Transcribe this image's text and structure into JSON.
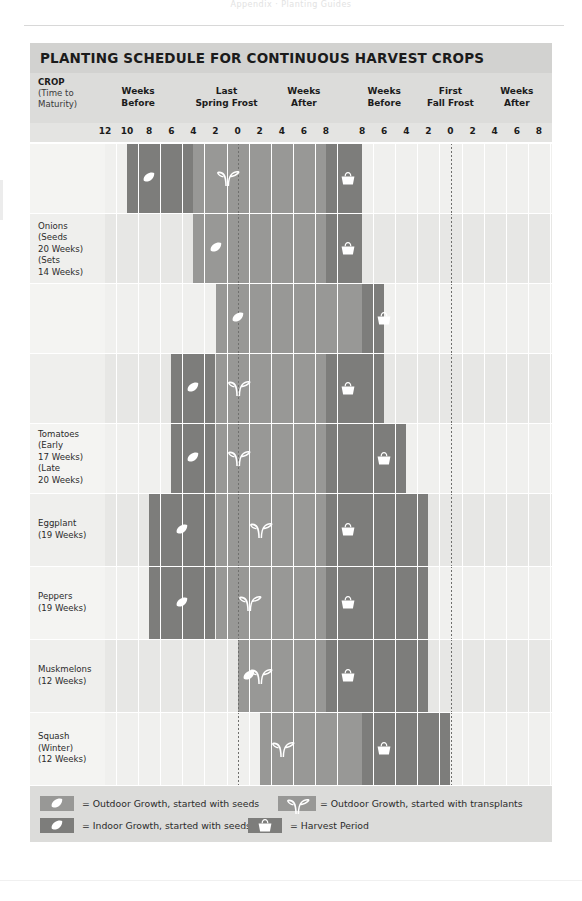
{
  "runhead": "Appendix  ·  Planting Guides",
  "title": "PLANTING SCHEDULE FOR CONTINUOUS HARVEST CROPS",
  "header": {
    "crop_label_line1": "CROP",
    "crop_label_line2": "(Time to",
    "crop_label_line3": "Maturity)",
    "groups": [
      {
        "name": "weeks-before-spring",
        "line1": "Weeks",
        "line2": "Before"
      },
      {
        "name": "last-spring-frost",
        "line1": "Last",
        "line2": "Spring Frost"
      },
      {
        "name": "weeks-after-spring",
        "line1": "Weeks",
        "line2": "After"
      },
      {
        "name": "weeks-before-fall",
        "line1": "Weeks",
        "line2": "Before"
      },
      {
        "name": "first-fall-frost",
        "line1": "First",
        "line2": "Fall Frost"
      },
      {
        "name": "weeks-after-fall",
        "line1": "Weeks",
        "line2": "After"
      }
    ]
  },
  "ticks": [
    "12",
    "10",
    "8",
    "6",
    "4",
    "2",
    "0",
    "2",
    "4",
    "6",
    "8",
    "8",
    "6",
    "4",
    "2",
    "0",
    "2",
    "4",
    "6",
    "8"
  ],
  "crops": [
    {
      "name": "onions-seeds",
      "label": ""
    },
    {
      "name": "onions-sets",
      "label": "Onions\n(Seeds\n20 Weeks)\n(Sets\n14 Weeks)"
    },
    {
      "name": "onions-third",
      "label": ""
    },
    {
      "name": "tomatoes-early",
      "label": ""
    },
    {
      "name": "tomatoes-late",
      "label": "Tomatoes\n(Early\n17 Weeks)\n(Late\n20 Weeks)"
    },
    {
      "name": "eggplant",
      "label": "Eggplant\n(19 Weeks)"
    },
    {
      "name": "peppers",
      "label": "Peppers\n(19 Weeks)"
    },
    {
      "name": "muskmelons",
      "label": "Muskmelons\n(12 Weeks)"
    },
    {
      "name": "squash-winter",
      "label": "Squash\n(Winter)\n(12 Weeks)"
    }
  ],
  "legend": [
    {
      "name": "outdoor-seeds",
      "swatch": "mid",
      "glyph": "seed",
      "text": "= Outdoor Growth, started with seeds"
    },
    {
      "name": "outdoor-transplants",
      "swatch": "mid",
      "glyph": "sprout",
      "text": "= Outdoor Growth, started with transplants"
    },
    {
      "name": "indoor-seeds",
      "swatch": "dark",
      "glyph": "seed",
      "text": "= Indoor Growth, started with seeds"
    },
    {
      "name": "harvest-period",
      "swatch": "dark",
      "glyph": "basket",
      "text": "= Harvest Period"
    }
  ],
  "colors": {
    "title_bar": "#d2d2d0",
    "header_bar": "#dcdcda",
    "bar_mid": "#989896",
    "bar_dark": "#7d7d7b",
    "row_alt": "#e7e7e5",
    "row_plain": "#f0f0ee"
  },
  "chart_data": {
    "type": "bar",
    "title": "PLANTING SCHEDULE FOR CONTINUOUS HARVEST CROPS",
    "xlabel": "Weeks relative to Last Spring Frost and First Fall Frost",
    "ylabel": "Crop",
    "grid": true,
    "legend_position": "bottom",
    "axis_scale_weeks": [
      "-12",
      "-10",
      "-8",
      "-6",
      "-4",
      "-2",
      "0",
      "+2",
      "+4",
      "+6",
      "+8",
      "-8",
      "-6",
      "-4",
      "-2",
      "0",
      "+2",
      "+4",
      "+6",
      "+8"
    ],
    "categories": [
      "Onions (Seeds 20 Weeks) — planting 1",
      "Onions (Sets 14 Weeks) — planting 2",
      "Onions — planting 3",
      "Tomatoes (Early 17 Weeks)",
      "Tomatoes (Late 20 Weeks)",
      "Eggplant (19 Weeks)",
      "Peppers (19 Weeks)",
      "Muskmelons (12 Weeks)",
      "Squash (Winter) (12 Weeks)"
    ],
    "series": [
      {
        "name": "Onions (Seeds 20 Weeks) — planting 1",
        "segments": [
          {
            "type": "indoor-seeds",
            "start_week": -10,
            "end_week": -4,
            "icon": "seed",
            "icon_week": -9
          },
          {
            "type": "outdoor-transplants",
            "start_week": -4,
            "end_week": 8,
            "icon": "sprout",
            "icon_week": -2
          },
          {
            "type": "harvest",
            "start_week": 8,
            "end_week": 10,
            "icon": "basket",
            "icon_week": 9
          }
        ]
      },
      {
        "name": "Onions (Sets 14 Weeks) — planting 2",
        "segments": [
          {
            "type": "outdoor-seeds",
            "start_week": -4,
            "end_week": 8,
            "icon": "seed",
            "icon_week": -3
          },
          {
            "type": "harvest",
            "start_week": 8,
            "end_week": 10,
            "icon": "basket",
            "icon_week": 9
          }
        ]
      },
      {
        "name": "Onions — planting 3",
        "segments": [
          {
            "type": "outdoor-seeds",
            "start_week": -2,
            "end_week": 10,
            "icon": "seed",
            "icon_week": -1
          },
          {
            "type": "harvest",
            "start_week": 10,
            "end_week": 12,
            "icon": "basket",
            "icon_week": 11
          }
        ]
      },
      {
        "name": "Tomatoes (Early 17 Weeks)",
        "segments": [
          {
            "type": "indoor-seeds",
            "start_week": -6,
            "end_week": -2,
            "icon": "seed",
            "icon_week": -5
          },
          {
            "type": "outdoor-transplants",
            "start_week": -2,
            "end_week": 8,
            "icon": "sprout",
            "icon_week": -1
          },
          {
            "type": "harvest",
            "start_week": 8,
            "end_week": 12,
            "icon": "basket",
            "icon_week": 9
          }
        ]
      },
      {
        "name": "Tomatoes (Late 20 Weeks)",
        "segments": [
          {
            "type": "indoor-seeds",
            "start_week": -6,
            "end_week": -2,
            "icon": "seed",
            "icon_week": -5
          },
          {
            "type": "outdoor-transplants",
            "start_week": -2,
            "end_week": 8,
            "icon": "sprout",
            "icon_week": -1
          },
          {
            "type": "harvest",
            "start_week": 8,
            "end_week": 14,
            "icon": "basket",
            "icon_week": 11
          }
        ]
      },
      {
        "name": "Eggplant (19 Weeks)",
        "segments": [
          {
            "type": "indoor-seeds",
            "start_week": -8,
            "end_week": -2,
            "icon": "seed",
            "icon_week": -6
          },
          {
            "type": "outdoor-transplants",
            "start_week": -2,
            "end_week": 8,
            "icon": "sprout",
            "icon_week": 1
          },
          {
            "type": "harvest",
            "start_week": 8,
            "end_week": 16,
            "icon": "basket",
            "icon_week": 9
          }
        ]
      },
      {
        "name": "Peppers (19 Weeks)",
        "segments": [
          {
            "type": "indoor-seeds",
            "start_week": -8,
            "end_week": -2,
            "icon": "seed",
            "icon_week": -6
          },
          {
            "type": "outdoor-transplants",
            "start_week": -2,
            "end_week": 8,
            "icon": "sprout",
            "icon_week": 0
          },
          {
            "type": "harvest",
            "start_week": 8,
            "end_week": 16,
            "icon": "basket",
            "icon_week": 9
          }
        ]
      },
      {
        "name": "Muskmelons (12 Weeks)",
        "segments": [
          {
            "type": "outdoor-transplants",
            "start_week": 0,
            "end_week": 8,
            "icon": "sprout",
            "icon_week": 1,
            "icon2": "seed",
            "icon2_week": 0
          },
          {
            "type": "harvest",
            "start_week": 8,
            "end_week": 16,
            "icon": "basket",
            "icon_week": 9
          }
        ]
      },
      {
        "name": "Squash (Winter) (12 Weeks)",
        "segments": [
          {
            "type": "outdoor-transplants",
            "start_week": 2,
            "end_week": 10,
            "icon": "sprout",
            "icon_week": 3
          },
          {
            "type": "harvest",
            "start_week": 10,
            "end_week": 18,
            "icon": "basket",
            "icon_week": 11
          }
        ]
      }
    ]
  }
}
